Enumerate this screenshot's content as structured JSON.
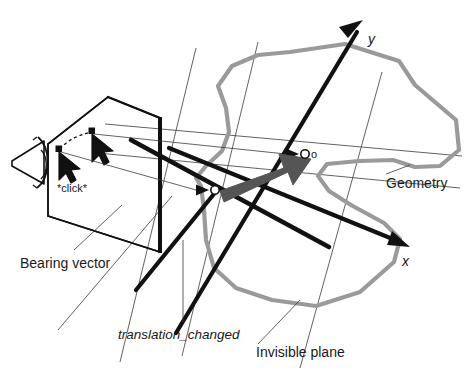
{
  "figure": {
    "background_color": "#ffffff"
  },
  "labels": {
    "bearing_vector": "Bearing vector",
    "click": "*click*",
    "translation_changed": "translation_changed",
    "invisible_plane": "Invisible plane",
    "geometry": "Geometry",
    "axis_x": "x",
    "axis_y": "y",
    "origin_start": "o",
    "origin_end": "o"
  },
  "colors": {
    "ink": "#111111",
    "thin_line": "#3a3a3a",
    "geometry_outline": "#9a9a9a",
    "translation_arrow": "#555555",
    "node_fill": "#ffffff"
  },
  "elements": {
    "camera_icon": "camera-eye-icon",
    "image_plane": "image-plane-quad",
    "cursor_start": "cursor-arrow-icon",
    "cursor_end": "cursor-arrow-icon",
    "drag_path": "dashed-drag-path",
    "bearing_ray_start": "bearing-ray-line",
    "bearing_ray_end": "bearing-ray-line",
    "translation_arrow": "translation-arrow",
    "geometry_outline": "geometry-polygon",
    "invisible_plane_grid": "invisible-plane-gridlines",
    "axis_x_arrow": "x-axis-arrow",
    "axis_y_arrow": "y-axis-arrow"
  },
  "geometry_outline_points": "290,52 345,44 399,61 415,85 456,120 459,150 440,166 415,167 393,160 359,161 327,164 318,176 329,191 351,205 384,223 400,239 394,262 360,292 316,306 272,300 236,288 214,268 206,240 204,210 201,186 196,178 206,166 222,151 229,132 226,108 218,86 232,66 258,55",
  "invisible_plane_gridlines": [
    {
      "name": "grid-line-a",
      "x1": 105,
      "y1": 124,
      "x2": 462,
      "y2": 156
    },
    {
      "name": "grid-line-b",
      "x1": 98,
      "y1": 153,
      "x2": 460,
      "y2": 188
    },
    {
      "name": "grid-line-c",
      "x1": 196,
      "y1": 48,
      "x2": 120,
      "y2": 362
    },
    {
      "name": "grid-line-d",
      "x1": 258,
      "y1": 42,
      "x2": 182,
      "y2": 356
    },
    {
      "name": "grid-line-e",
      "x1": 382,
      "y1": 72,
      "x2": 300,
      "y2": 368
    },
    {
      "name": "grid-line-f",
      "x1": 172,
      "y1": 196,
      "x2": 58,
      "y2": 330
    }
  ],
  "image_plane_quad": "48,144 108,97 160,118 160,252 48,216",
  "cursors": [
    {
      "name": "cursor-start",
      "dot": {
        "x": 59,
        "y": 149
      },
      "tip": {
        "x": 61,
        "y": 152
      }
    },
    {
      "name": "cursor-end",
      "dot": {
        "x": 92,
        "y": 131
      },
      "tip": {
        "x": 94,
        "y": 134
      }
    }
  ],
  "nodes": [
    {
      "name": "start-node",
      "x": 215,
      "y": 190,
      "r": 4.2
    },
    {
      "name": "end-node",
      "x": 305,
      "y": 154,
      "r": 4.2
    }
  ],
  "axes": {
    "x": {
      "x1": 169,
      "y1": 148,
      "x2": 412,
      "y2": 247
    },
    "y": {
      "x1": 176,
      "y1": 333,
      "x2": 363,
      "y2": 20
    }
  }
}
